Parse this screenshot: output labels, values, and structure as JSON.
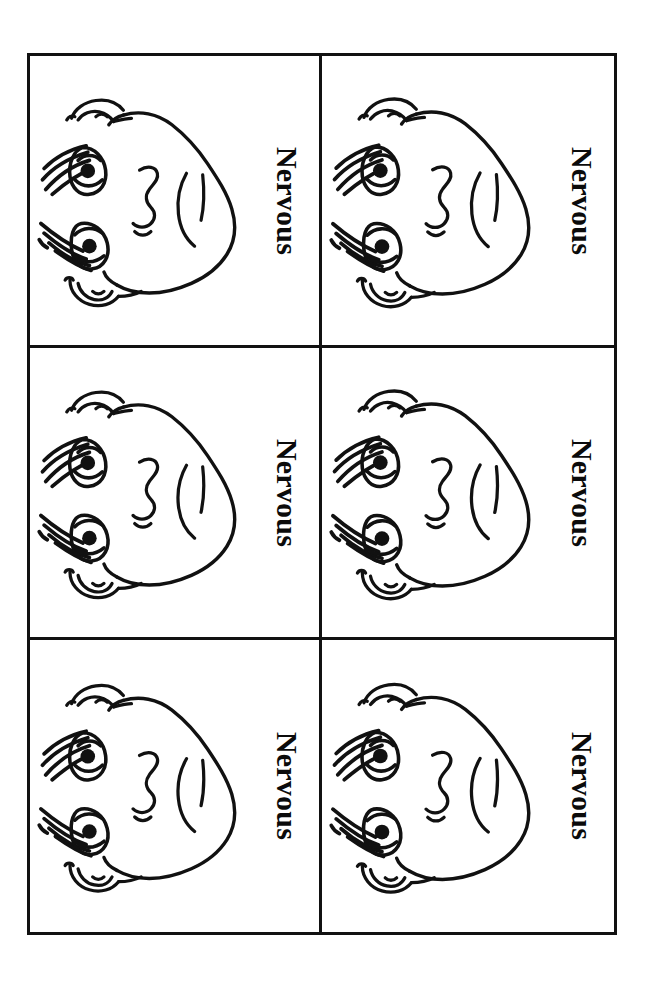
{
  "page": {
    "background_color": "#ffffff",
    "ink_color": "#111111",
    "orientation_note": "landscape card sheet shown rotated 90 degrees"
  },
  "sheet": {
    "columns": 2,
    "rows": 3,
    "border_color": "#111111",
    "cards": [
      {
        "label": "Nervous",
        "face": "nervous-face",
        "position": "row-1-col-1"
      },
      {
        "label": "Nervous",
        "face": "nervous-face",
        "position": "row-1-col-2"
      },
      {
        "label": "Nervous",
        "face": "nervous-face",
        "position": "row-2-col-1"
      },
      {
        "label": "Nervous",
        "face": "nervous-face",
        "position": "row-2-col-2"
      },
      {
        "label": "Nervous",
        "face": "nervous-face",
        "position": "row-3-col-1"
      },
      {
        "label": "Nervous",
        "face": "nervous-face",
        "position": "row-3-col-2"
      }
    ]
  },
  "face_parts": {
    "head_outline": "head-outline",
    "ear_top": "ear-icon-top",
    "ear_bottom": "ear-icon-bottom",
    "eye_upper": "eye-icon-upper",
    "eye_lower": "eye-icon-lower",
    "eyebrow_upper": "eyebrow-icon-upper",
    "eyebrow_lower": "eyebrow-icon-lower",
    "nose": "nose-icon",
    "mouth": "mouth-icon"
  }
}
